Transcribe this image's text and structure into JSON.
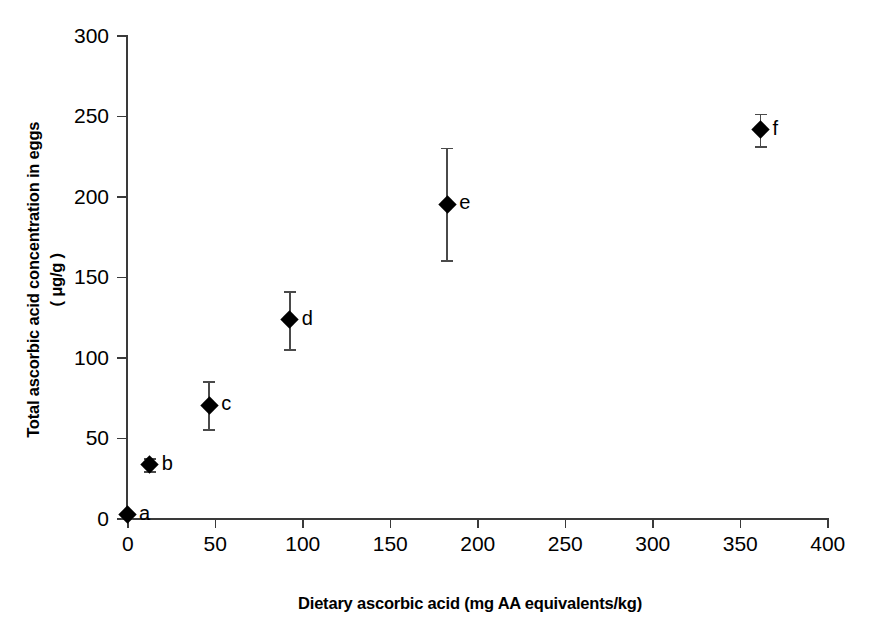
{
  "chart_data": {
    "type": "scatter",
    "title": "",
    "xlabel": "Dietary ascorbic acid (mg AA equivalents/kg)",
    "ylabel_line1": "Total ascorbic acid concentration in eggs",
    "ylabel_line2": "( μg/g )",
    "xlim": [
      0,
      400
    ],
    "ylim": [
      0,
      300
    ],
    "xticks": [
      0,
      50,
      100,
      150,
      200,
      250,
      300,
      350,
      400
    ],
    "yticks": [
      0,
      50,
      100,
      150,
      200,
      250,
      300
    ],
    "grid": false,
    "legend": false,
    "marker": "filled-diamond",
    "error_bars": "vertical",
    "series": [
      {
        "name": "Egg ascorbic acid",
        "points": [
          {
            "label": "a",
            "x": 0,
            "y": 2,
            "error": 2
          },
          {
            "label": "b",
            "x": 13,
            "y": 33,
            "error": 4
          },
          {
            "label": "c",
            "x": 47,
            "y": 70,
            "error": 15
          },
          {
            "label": "d",
            "x": 93,
            "y": 123,
            "error": 18
          },
          {
            "label": "e",
            "x": 183,
            "y": 195,
            "error": 35
          },
          {
            "label": "f",
            "x": 362,
            "y": 241,
            "error": 10
          }
        ]
      }
    ]
  },
  "colors": {
    "marker": "#000000",
    "axis": "#3a3a3a",
    "error_bar": "#4a4a4a",
    "background": "#ffffff",
    "text": "#000000"
  }
}
